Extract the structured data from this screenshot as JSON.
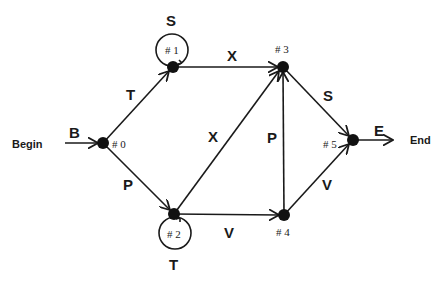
{
  "diagram": {
    "type": "finite-state-grammar",
    "terminals": {
      "start": "Begin",
      "end": "End"
    },
    "nodes": [
      {
        "id": "0",
        "label": "# 0"
      },
      {
        "id": "1",
        "label": "# 1"
      },
      {
        "id": "2",
        "label": "# 2"
      },
      {
        "id": "3",
        "label": "# 3"
      },
      {
        "id": "4",
        "label": "# 4"
      },
      {
        "id": "5",
        "label": "# 5"
      }
    ],
    "edges": [
      {
        "from": "Begin",
        "to": "0",
        "label": "B"
      },
      {
        "from": "0",
        "to": "1",
        "label": "T"
      },
      {
        "from": "0",
        "to": "2",
        "label": "P"
      },
      {
        "from": "1",
        "to": "1",
        "label": "S"
      },
      {
        "from": "1",
        "to": "3",
        "label": "X"
      },
      {
        "from": "2",
        "to": "2",
        "label": "T"
      },
      {
        "from": "2",
        "to": "3",
        "label": "X"
      },
      {
        "from": "2",
        "to": "4",
        "label": "V"
      },
      {
        "from": "4",
        "to": "3",
        "label": "P"
      },
      {
        "from": "3",
        "to": "5",
        "label": "S"
      },
      {
        "from": "4",
        "to": "5",
        "label": "V"
      },
      {
        "from": "5",
        "to": "End",
        "label": "E"
      }
    ]
  }
}
